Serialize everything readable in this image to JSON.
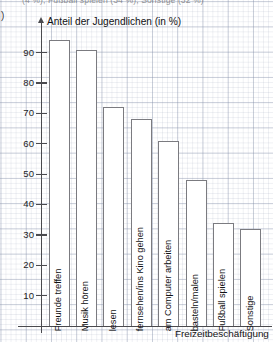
{
  "page": {
    "cutoff_header_text": "(4 %), Fußball spielen (34 %), Sonstige (32 %)",
    "item_marker": ")"
  },
  "chart_data": {
    "type": "bar",
    "title": "",
    "ylabel": "Anteil der Jugendlichen (in %)",
    "xlabel": "Freizeitbeschäftigung",
    "categories": [
      "Freunde treffen",
      "Musik hören",
      "lesen",
      "fernsehen/ins Kino gehen",
      "am Computer arbeiten",
      "basteln/malen",
      "Fußball spielen",
      "Sonstige"
    ],
    "values": [
      94,
      91,
      72,
      68,
      61,
      48,
      34,
      32
    ],
    "ylim": [
      0,
      100
    ],
    "yticks": [
      10,
      20,
      30,
      40,
      50,
      60,
      70,
      80,
      90
    ],
    "ytick_labels": [
      "10",
      "20",
      "30",
      "40",
      "50",
      "60",
      "70",
      "80",
      "90"
    ],
    "grid": true,
    "legend": null,
    "bar_fill_color": "#ffffff",
    "bar_edge_color": "#7b7b80",
    "axis_color": "#4a4a4e",
    "grid_color": "#8c96af"
  }
}
